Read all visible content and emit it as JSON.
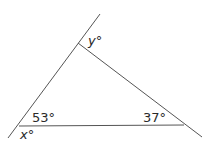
{
  "diagram": {
    "type": "triangle-with-extended-sides",
    "stroke_color": "#555555",
    "labels": {
      "angle_bottom_left": "53°",
      "angle_bottom_right": "37°",
      "exterior_bottom_left": "x°",
      "exterior_top": "y°"
    },
    "vertices": {
      "top": [
        78,
        43
      ],
      "bottom_left": [
        19,
        126
      ],
      "bottom_right": [
        184,
        125
      ]
    }
  }
}
